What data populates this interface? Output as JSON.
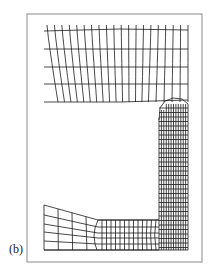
{
  "figure": {
    "panel_label": "(b)",
    "line_color": "#1a1a1a",
    "frame_color": "#8a8a8a",
    "background": "#ffffff"
  }
}
